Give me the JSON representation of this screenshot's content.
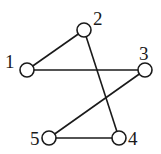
{
  "graph": {
    "nodes": [
      {
        "id": "1",
        "label": "1",
        "x": 27,
        "y": 70,
        "lx": 5,
        "ly": 68
      },
      {
        "id": "2",
        "label": "2",
        "x": 84,
        "y": 30,
        "lx": 93,
        "ly": 25
      },
      {
        "id": "3",
        "label": "3",
        "x": 145,
        "y": 70,
        "lx": 139,
        "ly": 60
      },
      {
        "id": "4",
        "label": "4",
        "x": 119,
        "y": 138,
        "lx": 128,
        "ly": 145
      },
      {
        "id": "5",
        "label": "5",
        "x": 49,
        "y": 138,
        "lx": 30,
        "ly": 145
      }
    ],
    "edges": [
      {
        "from": "1",
        "to": "2"
      },
      {
        "from": "1",
        "to": "3"
      },
      {
        "from": "2",
        "to": "4"
      },
      {
        "from": "3",
        "to": "5"
      },
      {
        "from": "5",
        "to": "4"
      }
    ],
    "node_radius": 7,
    "colors": {
      "stroke": "#1a1a1a",
      "fill": "#ffffff"
    }
  }
}
